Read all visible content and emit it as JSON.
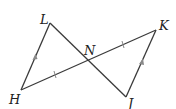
{
  "diagram": {
    "points": {
      "L": {
        "label": "L",
        "x": 50,
        "y": 23
      },
      "K": {
        "label": "K",
        "x": 156,
        "y": 30
      },
      "N": {
        "label": "N",
        "x": 88,
        "y": 61
      },
      "H": {
        "label": "H",
        "x": 21,
        "y": 90
      },
      "J": {
        "label": "J",
        "x": 126,
        "y": 97
      }
    },
    "segments": [
      {
        "from": "L",
        "to": "H",
        "marker": "parallel-arrow"
      },
      {
        "from": "L",
        "to": "J",
        "marker": "none"
      },
      {
        "from": "H",
        "to": "K",
        "marker": "none"
      },
      {
        "from": "K",
        "to": "J",
        "marker": "parallel-arrow"
      }
    ],
    "congruence_ticks": [
      "HN",
      "NK"
    ],
    "labels": {
      "L": "L",
      "K": "K",
      "N": "N",
      "H": "H",
      "J": "J"
    }
  }
}
